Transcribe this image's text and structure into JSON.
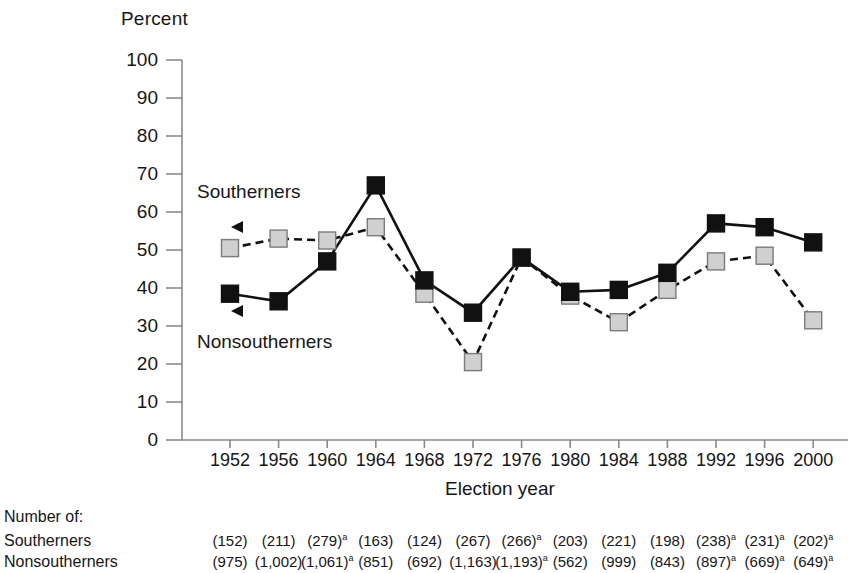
{
  "chart_data": {
    "type": "line",
    "title": "",
    "xlabel": "Election year",
    "ylabel": "Percent",
    "ylim": [
      0,
      100
    ],
    "ytick_labels": [
      "100",
      "90",
      "80",
      "70",
      "60",
      "50",
      "40",
      "30",
      "20",
      "10",
      "0"
    ],
    "ytick_values": [
      100,
      90,
      80,
      70,
      60,
      50,
      40,
      30,
      20,
      10,
      0
    ],
    "grid": false,
    "legend_position": "inline-annotated",
    "categories": [
      "1952",
      "1956",
      "1960",
      "1964",
      "1968",
      "1972",
      "1976",
      "1980",
      "1984",
      "1988",
      "1992",
      "1996",
      "2000"
    ],
    "series": [
      {
        "name": "Southerners",
        "marker": "filled-square-black",
        "line_style": "solid",
        "color": "#111111",
        "values": [
          38.5,
          36.5,
          47,
          67,
          42,
          33.5,
          48,
          39,
          39.5,
          44,
          57,
          56,
          52
        ]
      },
      {
        "name": "Nonsoutherners",
        "marker": "filled-square-gray",
        "line_style": "dashed",
        "color": "#cccccc",
        "values": [
          50.5,
          53,
          52.5,
          56,
          38.5,
          20.5,
          48,
          38,
          31,
          39.5,
          47,
          48.5,
          31.5
        ]
      }
    ],
    "annotations": [
      {
        "label": "Southerners",
        "arrow": "left-triangle"
      },
      {
        "label": "Nonsoutherners",
        "arrow": "left-triangle"
      }
    ]
  },
  "footnote_table": {
    "caption": "Number of:",
    "rows": [
      {
        "label": "Southerners",
        "values": [
          {
            "text": "(152)",
            "sup": ""
          },
          {
            "text": "(211)",
            "sup": ""
          },
          {
            "text": "(279)",
            "sup": "a"
          },
          {
            "text": "(163)",
            "sup": ""
          },
          {
            "text": "(124)",
            "sup": ""
          },
          {
            "text": "(267)",
            "sup": ""
          },
          {
            "text": "(266)",
            "sup": "a"
          },
          {
            "text": "(203)",
            "sup": ""
          },
          {
            "text": "(221)",
            "sup": ""
          },
          {
            "text": "(198)",
            "sup": ""
          },
          {
            "text": "(238)",
            "sup": "a"
          },
          {
            "text": "(231)",
            "sup": "a"
          },
          {
            "text": "(202)",
            "sup": "a"
          }
        ]
      },
      {
        "label": "Nonsoutherners",
        "values": [
          {
            "text": "(975)",
            "sup": ""
          },
          {
            "text": "(1,002)",
            "sup": ""
          },
          {
            "text": "(1,061)",
            "sup": "a"
          },
          {
            "text": "(851)",
            "sup": ""
          },
          {
            "text": "(692)",
            "sup": ""
          },
          {
            "text": "(1,163)",
            "sup": ""
          },
          {
            "text": "(1,193)",
            "sup": "a"
          },
          {
            "text": "(562)",
            "sup": ""
          },
          {
            "text": "(999)",
            "sup": ""
          },
          {
            "text": "(843)",
            "sup": ""
          },
          {
            "text": "(897)",
            "sup": "a"
          },
          {
            "text": "(669)",
            "sup": "a"
          },
          {
            "text": "(649)",
            "sup": "a"
          }
        ]
      }
    ]
  },
  "colors": {
    "axis": "#8a8a8a",
    "southerners_marker": "#111111",
    "nonsoutherners_marker": "#d0d0d0",
    "marker_border": "#7b7b7b",
    "text": "#161616"
  }
}
